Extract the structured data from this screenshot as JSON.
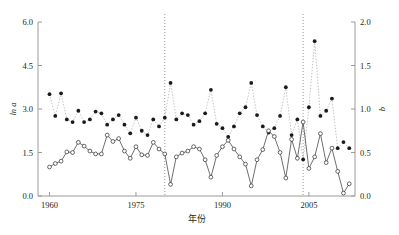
{
  "chart_data": {
    "type": "line",
    "title": "",
    "xlabel": "年份",
    "ylabel_left": "ln a",
    "ylabel_right": "b",
    "xlim": [
      1958,
      2013
    ],
    "xticks": [
      1960,
      1975,
      1990,
      2005
    ],
    "xtick_labels": [
      "1960",
      "1975",
      "1990",
      "2005"
    ],
    "ylim_left": [
      0.0,
      6.0
    ],
    "yticks_left": [
      0.0,
      1.5,
      3.0,
      4.5,
      6.0
    ],
    "ytick_labels_left": [
      "0.0",
      "1.5",
      "3.0",
      "4.5",
      "6.0"
    ],
    "ylim_right": [
      0.0,
      2.0
    ],
    "yticks_right": [
      0.0,
      0.5,
      1.0,
      1.5,
      2.0
    ],
    "ytick_labels_right": [
      "0.0",
      "0.5",
      "1.0",
      "1.5",
      "2.0"
    ],
    "grid": false,
    "legend_position": "top-center",
    "legend": [
      {
        "name": "ln a",
        "marker": "open-circle",
        "line": "solid",
        "axis": "left"
      },
      {
        "name": "b",
        "marker": "filled-circle",
        "line": "dotted",
        "axis": "right"
      }
    ],
    "period_dividers": [
      1980,
      2004
    ],
    "x": [
      1960,
      1961,
      1962,
      1963,
      1964,
      1965,
      1966,
      1967,
      1968,
      1969,
      1970,
      1971,
      1972,
      1973,
      1974,
      1975,
      1976,
      1977,
      1978,
      1979,
      1980,
      1981,
      1982,
      1983,
      1984,
      1985,
      1986,
      1987,
      1988,
      1989,
      1990,
      1991,
      1992,
      1993,
      1994,
      1995,
      1996,
      1997,
      1998,
      1999,
      2000,
      2001,
      2002,
      2003,
      2004,
      2005,
      2006,
      2007,
      2008,
      2009,
      2010,
      2011,
      2012
    ],
    "series": [
      {
        "name": "ln a",
        "axis": "left",
        "marker": "open-circle",
        "line": "solid",
        "values": [
          1.0,
          1.12,
          1.2,
          1.52,
          1.5,
          1.85,
          1.72,
          1.55,
          1.45,
          1.45,
          2.1,
          1.88,
          1.98,
          1.55,
          1.3,
          1.7,
          1.42,
          1.4,
          1.85,
          1.62,
          1.45,
          0.4,
          1.35,
          1.48,
          1.55,
          1.7,
          1.62,
          1.25,
          0.65,
          1.4,
          1.7,
          1.92,
          1.62,
          1.35,
          1.1,
          0.35,
          1.25,
          1.6,
          2.25,
          2.05,
          1.5,
          0.62,
          1.95,
          1.3,
          2.55,
          0.95,
          1.35,
          2.15,
          1.15,
          1.65,
          0.85,
          0.1,
          0.42
        ]
      },
      {
        "name": "b",
        "axis": "right",
        "marker": "filled-circle",
        "line": "dotted",
        "values": [
          1.17,
          0.92,
          1.18,
          0.88,
          0.85,
          0.98,
          0.85,
          0.88,
          0.97,
          0.95,
          0.82,
          0.88,
          0.93,
          0.82,
          0.72,
          0.9,
          0.75,
          0.7,
          0.88,
          0.8,
          0.9,
          1.3,
          0.88,
          0.95,
          0.93,
          0.82,
          0.86,
          0.95,
          1.22,
          0.83,
          0.78,
          0.68,
          0.8,
          0.95,
          1.02,
          1.3,
          0.93,
          0.8,
          0.73,
          0.78,
          0.92,
          1.25,
          0.7,
          0.88,
          0.42,
          1.02,
          1.78,
          0.92,
          0.98,
          1.12,
          0.55,
          0.62,
          0.55
        ]
      }
    ],
    "trend_lines": [
      {
        "series": "b",
        "period": "1960-1980",
        "equation": "y = -0.019x + 38.108",
        "p_value": "P < 0.01",
        "x0": 1960,
        "y0": 1.03,
        "x1": 1980,
        "y1": 0.78
      },
      {
        "series": "ln a",
        "period": "1960-1980",
        "equation": "y = -0.012x + 25.752",
        "p_value": "P > 0.05",
        "x0": 1960,
        "y0": 1.58,
        "x1": 1980,
        "y1": 1.43
      },
      {
        "series": "b",
        "period": "1980-2004",
        "equation": "y = -0.006x + 12.865",
        "p_value": "P > 0.05",
        "x0": 1980,
        "y1": 0.9,
        "y0": 0.97,
        "x1": 2004
      },
      {
        "series": "ln a",
        "period": "1980-2004",
        "equation": "y = 0.022x -41.636",
        "p_value": "P > 0.05",
        "x0": 1980,
        "y0": 1.22,
        "x1": 2004,
        "y1": 1.75
      },
      {
        "series": "b",
        "period": "2004-2012",
        "equation": "y = 0.006x -11.453",
        "p_value": "P > 0.05",
        "x0": 2004,
        "y0": 0.97,
        "x1": 2012,
        "y1": 1.02
      },
      {
        "series": "ln a",
        "period": "2004-2012",
        "equation": "y = -0.240x +484.610",
        "p_value": "P < 0.05",
        "x0": 2004,
        "y0": 2.2,
        "x1": 2012,
        "y1": 0.3
      }
    ],
    "annotations": [
      {
        "id": "eq1",
        "text": "y = -0.019x + 38.108",
        "sub": "P < 0.01",
        "x": 75,
        "y": 57
      },
      {
        "id": "eq2",
        "text": "y = -0.012x + 25.752",
        "sub": "P > 0.05",
        "x": 67,
        "y": 166
      },
      {
        "id": "eq3",
        "text": "y = -0.006x + 12.865",
        "sub": "P > 0.05",
        "x": 182,
        "y": 68
      },
      {
        "id": "eq4",
        "text": "y = 0.022x -41.636",
        "sub": "P > 0.05",
        "x": 176,
        "y": 172
      },
      {
        "id": "eq5",
        "text": "y = 0.006x -11.453",
        "sub": "P > 0.05",
        "x": 270,
        "y": 26
      },
      {
        "id": "eq6",
        "text": "y = -0.240x +484.610",
        "sub": "P < 0.05",
        "x": 262,
        "y": 172
      }
    ]
  }
}
